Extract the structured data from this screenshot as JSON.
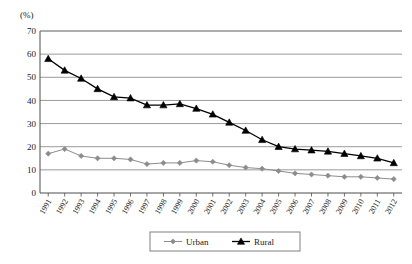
{
  "chart_data": {
    "type": "line",
    "title": "",
    "subtitle": "",
    "unit_label": "(%)",
    "xlabel": "",
    "ylabel": "",
    "ylim": [
      0,
      70
    ],
    "ytick_step": 10,
    "yticks": [
      "0",
      "10",
      "20",
      "30",
      "40",
      "50",
      "60",
      "70"
    ],
    "grid": true,
    "grid_axis": "y",
    "legend_position": "bottom-center",
    "categories": [
      "1991",
      "1992",
      "1993",
      "1994",
      "1995",
      "1996",
      "1997",
      "1998",
      "1999",
      "2000",
      "2001",
      "2002",
      "2003",
      "2004",
      "2005",
      "2006",
      "2007",
      "2008",
      "2009",
      "2010",
      "2011",
      "2012"
    ],
    "series": [
      {
        "name": "Urban",
        "color": "#8c8c8c",
        "marker": "diamond",
        "values": [
          17,
          19,
          16,
          15,
          15,
          14.5,
          12.5,
          13,
          13,
          14,
          13.5,
          12,
          11,
          10.5,
          9.5,
          8.5,
          8,
          7.5,
          7,
          7,
          6.5,
          6
        ]
      },
      {
        "name": "Rural",
        "color": "#000000",
        "marker": "triangle",
        "values": [
          58,
          53,
          49.5,
          45,
          41.5,
          41,
          38,
          38,
          38.5,
          36.5,
          34,
          30.5,
          27,
          23,
          20,
          19,
          18.5,
          18,
          17,
          16,
          15,
          13
        ]
      }
    ]
  },
  "legend": {
    "items": [
      {
        "label": "Urban"
      },
      {
        "label": "Rural"
      }
    ]
  },
  "colors": {
    "urban": "#8c8c8c",
    "rural": "#000000",
    "grid": "#808080",
    "axis": "#4d4d4d",
    "background": "#ffffff"
  }
}
